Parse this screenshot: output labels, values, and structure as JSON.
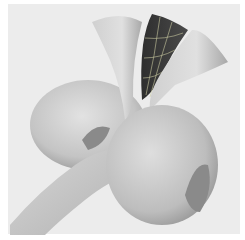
{
  "image": {
    "description": "Grayscale 3D rendering of smooth surfaces: a tube bending into two torus-like donut shapes with three trumpet/horn-shaped flared surfaces rising upward; one horn is dark with a light grid pattern",
    "colors": {
      "background": "#ececec",
      "surface_light": "#d4d4d4",
      "surface_mid": "#b0b0b0",
      "surface_dark": "#3c3c3c",
      "grid_lines": "#c8c8a0"
    }
  }
}
